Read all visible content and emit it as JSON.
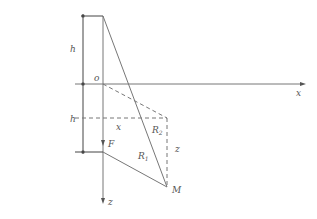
{
  "diagram": {
    "labels": {
      "h_top": "h",
      "h_bottom": "h",
      "origin": "o",
      "x_axis": "x",
      "z_axis": "z",
      "x_dist": "x",
      "z_dist": "z",
      "R1": "R",
      "R1_sub": "1",
      "R2": "R",
      "R2_sub": "2",
      "F": "F",
      "M": "M"
    }
  }
}
